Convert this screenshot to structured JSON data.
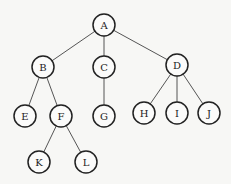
{
  "diagram": {
    "type": "tree",
    "root": "A",
    "nodes": [
      {
        "id": "A",
        "label": "A",
        "x": 104,
        "y": 25
      },
      {
        "id": "B",
        "label": "B",
        "x": 43,
        "y": 67
      },
      {
        "id": "C",
        "label": "C",
        "x": 104,
        "y": 67
      },
      {
        "id": "D",
        "label": "D",
        "x": 177,
        "y": 65
      },
      {
        "id": "E",
        "label": "E",
        "x": 25,
        "y": 116
      },
      {
        "id": "F",
        "label": "F",
        "x": 61,
        "y": 116
      },
      {
        "id": "G",
        "label": "G",
        "x": 104,
        "y": 116
      },
      {
        "id": "H",
        "label": "H",
        "x": 144,
        "y": 113
      },
      {
        "id": "I",
        "label": "I",
        "x": 177,
        "y": 113
      },
      {
        "id": "J",
        "label": "J",
        "x": 209,
        "y": 113
      },
      {
        "id": "K",
        "label": "K",
        "x": 39,
        "y": 162
      },
      {
        "id": "L",
        "label": "L",
        "x": 86,
        "y": 162
      }
    ],
    "edges": [
      [
        "A",
        "B"
      ],
      [
        "A",
        "C"
      ],
      [
        "A",
        "D"
      ],
      [
        "B",
        "E"
      ],
      [
        "B",
        "F"
      ],
      [
        "C",
        "G"
      ],
      [
        "D",
        "H"
      ],
      [
        "D",
        "I"
      ],
      [
        "D",
        "J"
      ],
      [
        "F",
        "K"
      ],
      [
        "F",
        "L"
      ]
    ],
    "node_radius": 11
  }
}
